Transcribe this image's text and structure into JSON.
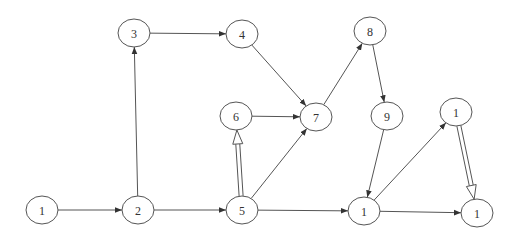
{
  "diagram": {
    "type": "directed-graph",
    "nodes": [
      {
        "id": "n1",
        "label": "1",
        "x": 42,
        "y": 210
      },
      {
        "id": "n2",
        "label": "2",
        "x": 138,
        "y": 210
      },
      {
        "id": "n3",
        "label": "3",
        "x": 134,
        "y": 33
      },
      {
        "id": "n4",
        "label": "4",
        "x": 242,
        "y": 34
      },
      {
        "id": "n5",
        "label": "5",
        "x": 242,
        "y": 210
      },
      {
        "id": "n6",
        "label": "6",
        "x": 236,
        "y": 116
      },
      {
        "id": "n7",
        "label": "7",
        "x": 316,
        "y": 117
      },
      {
        "id": "n8",
        "label": "8",
        "x": 370,
        "y": 31
      },
      {
        "id": "n9",
        "label": "9",
        "x": 387,
        "y": 116
      },
      {
        "id": "n10",
        "label": "1",
        "x": 364,
        "y": 211
      },
      {
        "id": "n11",
        "label": "1",
        "x": 456,
        "y": 112
      },
      {
        "id": "n12",
        "label": "1",
        "x": 477,
        "y": 213
      }
    ],
    "edges": [
      {
        "from": "n1",
        "to": "n2",
        "style": "single"
      },
      {
        "from": "n2",
        "to": "n3",
        "style": "single"
      },
      {
        "from": "n2",
        "to": "n5",
        "style": "single"
      },
      {
        "from": "n3",
        "to": "n4",
        "style": "single"
      },
      {
        "from": "n4",
        "to": "n7",
        "style": "single"
      },
      {
        "from": "n5",
        "to": "n6",
        "style": "double"
      },
      {
        "from": "n5",
        "to": "n7",
        "style": "single"
      },
      {
        "from": "n5",
        "to": "n10",
        "style": "single"
      },
      {
        "from": "n6",
        "to": "n7",
        "style": "single"
      },
      {
        "from": "n7",
        "to": "n8",
        "style": "single"
      },
      {
        "from": "n8",
        "to": "n9",
        "style": "single"
      },
      {
        "from": "n9",
        "to": "n10",
        "style": "single"
      },
      {
        "from": "n10",
        "to": "n11",
        "style": "single"
      },
      {
        "from": "n10",
        "to": "n12",
        "style": "single"
      },
      {
        "from": "n11",
        "to": "n12",
        "style": "double"
      }
    ],
    "colors": {
      "stroke": "#555555",
      "text": "#333333",
      "background": "#ffffff"
    }
  }
}
